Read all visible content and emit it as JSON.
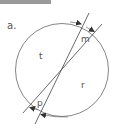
{
  "figure": {
    "panel_label": "a.",
    "region_labels": {
      "t": "t",
      "m": "m",
      "r": "r",
      "p": "p"
    },
    "colors": {
      "stroke": "#555555",
      "topbar": "#9a9a9a",
      "background": "#ffffff"
    }
  }
}
